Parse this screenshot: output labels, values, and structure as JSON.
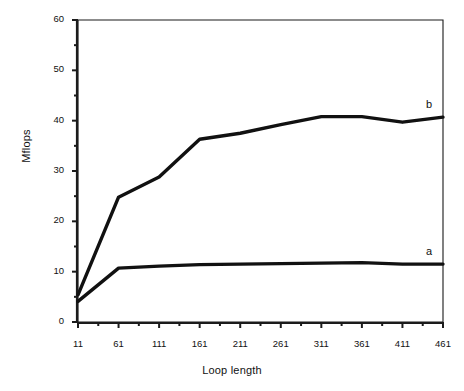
{
  "chart_data": {
    "type": "line",
    "title": "",
    "xlabel": "Loop length",
    "ylabel": "Mflops",
    "xlim": [
      11,
      461
    ],
    "ylim": [
      0,
      60
    ],
    "grid": false,
    "legend_position": "inline-right-end",
    "x_ticks": [
      11,
      61,
      111,
      161,
      211,
      261,
      311,
      361,
      411,
      461
    ],
    "x_tick_labels": [
      "11",
      "61",
      "111",
      "161",
      "211",
      "261",
      "311",
      "361",
      "411",
      "461"
    ],
    "x_minor_tick_step": 25,
    "y_ticks": [
      0,
      10,
      20,
      30,
      40,
      50,
      60
    ],
    "y_tick_labels": [
      "0",
      "10",
      "20",
      "30",
      "40",
      "50",
      "60"
    ],
    "y_minor_tick_step": 5,
    "series": [
      {
        "name": "a",
        "label": "a",
        "color": "#111111",
        "x": [
          11,
          61,
          111,
          161,
          211,
          261,
          311,
          361,
          411,
          461
        ],
        "values": [
          4.1,
          10.7,
          11.1,
          11.4,
          11.5,
          11.6,
          11.7,
          11.8,
          11.5,
          11.5
        ]
      },
      {
        "name": "b",
        "label": "b",
        "color": "#111111",
        "x": [
          11,
          61,
          111,
          161,
          211,
          261,
          311,
          361,
          411,
          461
        ],
        "values": [
          5.4,
          24.8,
          28.8,
          36.3,
          37.5,
          39.2,
          40.8,
          40.8,
          39.7,
          40.7
        ]
      }
    ]
  },
  "axes": {
    "y_title": "Mflops",
    "x_title": "Loop length"
  }
}
